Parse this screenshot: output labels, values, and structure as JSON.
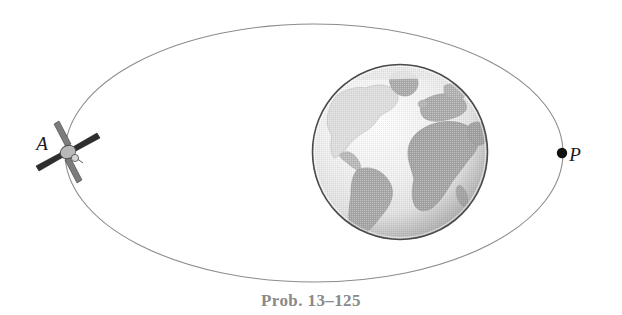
{
  "figure": {
    "kind": "orbital-mechanics-diagram",
    "caption": "Prob. 13–125",
    "background_color": "#ffffff",
    "orbit": {
      "name": "elliptical-orbit-path",
      "shape": "ellipse",
      "center_x": 314,
      "center_y": 153,
      "radius_x": 249,
      "radius_y": 129,
      "stroke_color": "#8c8c8c",
      "stroke_width": 1.1,
      "fill": "none"
    },
    "earth": {
      "name": "earth-globe",
      "center_x": 400,
      "center_y": 152,
      "radius": 88,
      "outline_color": "#4a4a4a",
      "ocean_light_color": "#ededed",
      "ocean_shade_color": "#c9c9c9",
      "land_color": "#a8a8a8",
      "land_light_color": "#d8d8d8",
      "terminator_color": "#b5b5b5",
      "continents_visible": [
        "North America",
        "South America",
        "Greenland",
        "Europe",
        "Africa",
        "Arabian Peninsula"
      ]
    },
    "satellite": {
      "name": "satellite-apogee",
      "x": 68,
      "y": 152,
      "body_color": "#b0b0b0",
      "panel_color": "#3a3a3a",
      "description": "small satellite with four solar panels in an X configuration"
    },
    "points": [
      {
        "id": "apogee",
        "label": "A",
        "label_x": 42,
        "label_y": 150,
        "marker": "none",
        "marker_x": 68,
        "marker_y": 152,
        "color": "#1a1a1a"
      },
      {
        "id": "perigee",
        "label": "P",
        "label_x": 572,
        "label_y": 161,
        "marker": "filled-dot",
        "marker_x": 562,
        "marker_y": 153,
        "marker_radius": 5,
        "color": "#111111"
      }
    ],
    "caption_color": "#8a8a8a",
    "caption_x": 311,
    "caption_y": 306
  }
}
